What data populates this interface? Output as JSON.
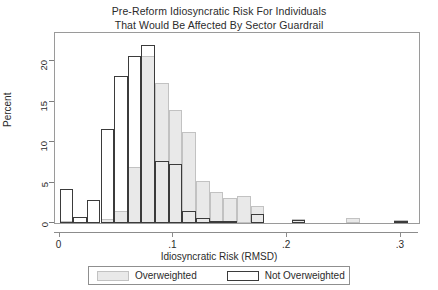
{
  "chart_data": {
    "type": "bar",
    "title": "Pre-Reform Idiosyncratic Risk For Individuals That Would Be Affected By Sector Guardrail",
    "title_lines": [
      "Pre-Reform Idiosyncratic Risk For Individuals",
      "That Would Be Affected By Sector Guardrail"
    ],
    "xlabel": "Idiosyncratic Risk (RMSD)",
    "ylabel": "Percent",
    "xlim": [
      -0.004,
      0.316
    ],
    "ylim": [
      0,
      23.5
    ],
    "xticks": [
      0,
      0.1,
      0.2,
      0.3
    ],
    "xtick_labels": [
      "0",
      ".1",
      ".2",
      ".3"
    ],
    "yticks": [
      0,
      5,
      10,
      15,
      20
    ],
    "ytick_labels": [
      "0",
      "5",
      "10",
      "15",
      "20"
    ],
    "grid": false,
    "legend_position": "below",
    "bin_width": 0.012,
    "bin_centers": [
      0.006,
      0.018,
      0.03,
      0.042,
      0.054,
      0.066,
      0.078,
      0.09,
      0.102,
      0.114,
      0.126,
      0.138,
      0.15,
      0.162,
      0.174,
      0.21,
      0.258,
      0.3
    ],
    "series": [
      {
        "name": "Overweighted",
        "color": "#e9e9e9",
        "edge_color": "#c2c2c2",
        "values": [
          0.3,
          0.0,
          0.0,
          0.5,
          1.5,
          6.9,
          20.7,
          17.3,
          14.0,
          11.3,
          5.2,
          3.8,
          3.1,
          3.3,
          2.1,
          0.5,
          0.6,
          0.4
        ]
      },
      {
        "name": "Not Overweighted",
        "color": "#ffffff",
        "edge_color": "#3b3b3b",
        "values": [
          4.2,
          0.7,
          2.8,
          11.6,
          18.2,
          20.6,
          22.0,
          7.7,
          7.3,
          1.5,
          0.6,
          0.3,
          0.2,
          0.0,
          1.1,
          0.4,
          0.0,
          0.3
        ]
      }
    ]
  },
  "legend": {
    "entries": [
      {
        "label": "Overweighted",
        "swatch": "overweighted-swatch"
      },
      {
        "label": "Not Overweighted",
        "swatch": "not-overweighted-swatch"
      }
    ]
  }
}
